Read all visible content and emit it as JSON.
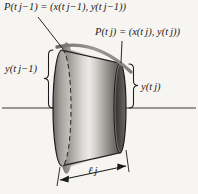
{
  "figure": {
    "background_color": "#f7f5f1",
    "ink_color": "#1b1b1b",
    "labels": {
      "point_previous": "P(t j−1) = (x(t j−1), y(t j−1))",
      "point_current": "P(t j) = (x(t j), y(t j))",
      "radius_previous": "y(t j−1)",
      "radius_current": "y(t j)",
      "slant_length": "ℓ j"
    },
    "label_parts": {
      "point_previous": {
        "func": "P",
        "arg": "t",
        "arg_sub": "j−1",
        "equals": "=",
        "comp_x": "x",
        "comp_y": "y"
      },
      "point_current": {
        "func": "P",
        "arg": "t",
        "arg_sub": "j",
        "equals": "=",
        "comp_x": "x",
        "comp_y": "y"
      },
      "radius_previous": {
        "func": "y",
        "arg": "t",
        "arg_sub": "j−1"
      },
      "radius_current": {
        "func": "y",
        "arg": "t",
        "arg_sub": "j"
      },
      "slant_length": {
        "symbol": "ℓ",
        "sub": "j"
      }
    },
    "geometry": {
      "axis_y": 108,
      "axis_x_start": 2,
      "axis_x_end": 196,
      "left_face_center_x": 62,
      "left_face_radius_x": 9,
      "left_face_radius_y": 58,
      "right_face_center_x": 120,
      "right_face_radius_x": 6,
      "right_face_radius_y": 45,
      "slant_arrow_y": 177,
      "slant_arrow_x_start": 58,
      "slant_arrow_x_end": 128
    },
    "colors": {
      "surface_light": "#e9e7e3",
      "surface_mid": "#a8a5a0",
      "surface_dark": "#5a5856",
      "curve_gray": "#8b8986",
      "outline": "#1b1b1b"
    },
    "elements": {
      "axis_of_revolution": "dash-dot horizontal axis",
      "revolved_curve": "thick gray arc across the top",
      "left_ellipse": "large circular face, back half dashed",
      "right_ellipse": "small dark circular face",
      "left_brace": "measures y(t j-1) from top vertex to axis",
      "right_brace": "measures y(t j) from top vertex to axis",
      "slant_dimension": "double-headed arrow for slant length"
    }
  }
}
